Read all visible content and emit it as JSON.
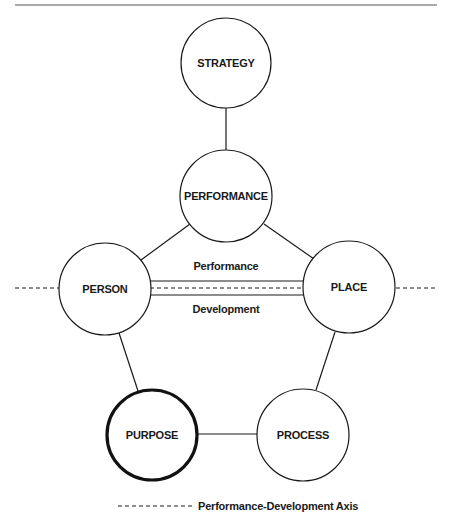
{
  "diagram": {
    "nodes": [
      {
        "id": "strategy",
        "label": "STRATEGY",
        "cx": 226,
        "cy": 63,
        "r": 45,
        "emphasized": false
      },
      {
        "id": "performance",
        "label": "PERFORMANCE",
        "cx": 226,
        "cy": 196,
        "r": 46,
        "emphasized": false
      },
      {
        "id": "person",
        "label": "PERSON",
        "cx": 105,
        "cy": 289,
        "r": 46,
        "emphasized": false
      },
      {
        "id": "place",
        "label": "PLACE",
        "cx": 349,
        "cy": 287,
        "r": 46,
        "emphasized": false
      },
      {
        "id": "purpose",
        "label": "PURPOSE",
        "cx": 152,
        "cy": 435,
        "r": 46,
        "emphasized": true
      },
      {
        "id": "process",
        "label": "PROCESS",
        "cx": 303,
        "cy": 435,
        "r": 46,
        "emphasized": false
      }
    ],
    "edges": [
      {
        "from": "strategy",
        "to": "performance"
      },
      {
        "from": "performance",
        "to": "person"
      },
      {
        "from": "performance",
        "to": "place"
      },
      {
        "from": "person",
        "to": "purpose"
      },
      {
        "from": "place",
        "to": "process"
      },
      {
        "from": "purpose",
        "to": "process"
      }
    ],
    "axis_link": {
      "from": "person",
      "to": "place",
      "top_label": "Performance",
      "bottom_label": "Development"
    },
    "legend": {
      "label": "Performance-Development Axis",
      "line_style": "dashed"
    },
    "colors": {
      "stroke": "#1a1a1a",
      "background": "#ffffff"
    }
  }
}
